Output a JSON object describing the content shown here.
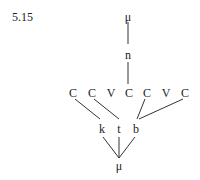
{
  "example_number": "5.15",
  "top": {
    "mu": "μ",
    "n": "n"
  },
  "skeleton": [
    "C",
    "C",
    "V",
    "C",
    "C",
    "V",
    "C"
  ],
  "consonants": [
    "k",
    "t",
    "b"
  ],
  "root_mu": "μ",
  "associations": [
    {
      "from": "n",
      "to_slot": 4
    },
    {
      "from": "k",
      "to_slot": 1
    },
    {
      "from": "t",
      "to_slot": 2
    },
    {
      "from": "b",
      "to_slot": 5
    },
    {
      "from": "b",
      "to_slot": 7
    }
  ]
}
